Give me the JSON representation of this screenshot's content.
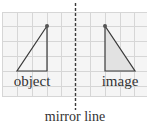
{
  "diagram": {
    "labels": {
      "object": "object",
      "image": "image",
      "mirror_line": "mirror line"
    },
    "colors": {
      "grid": "#d9d9d9",
      "grid_bg": "#f4f4f4",
      "outline": "#3a3a3a",
      "image_fill": "#e4e4e4",
      "mirror": "#3a3a3a",
      "text": "#333333"
    },
    "grid": {
      "x0": 2,
      "x1": 147,
      "y0": 12,
      "y1": 97,
      "spacing": 14.5
    },
    "object_triangle": {
      "points": [
        [
          47,
          26
        ],
        [
          17,
          71
        ],
        [
          47,
          71
        ]
      ],
      "fill": "none"
    },
    "image_triangle": {
      "points": [
        [
          105,
          26
        ],
        [
          105,
          71
        ],
        [
          135,
          71
        ]
      ],
      "fill": "#e4e4e4"
    },
    "mirror_line": {
      "x": 75,
      "y0": 3,
      "y1": 110
    }
  }
}
